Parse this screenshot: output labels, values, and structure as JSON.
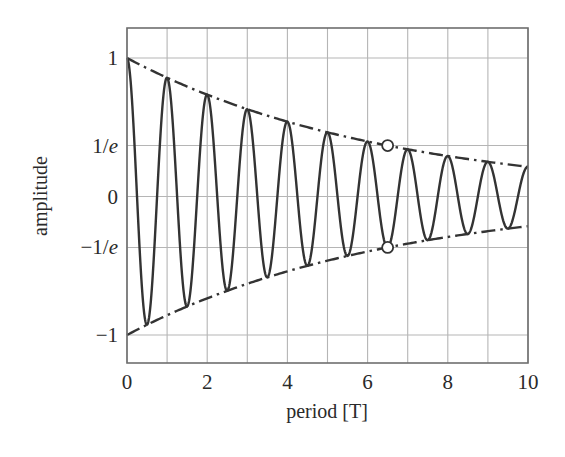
{
  "chart_data": {
    "type": "line",
    "title": "",
    "xlabel": "period [T]",
    "ylabel": "amplitude",
    "xlim": [
      0,
      10
    ],
    "ylim": [
      -1.1,
      1.1
    ],
    "grid": true,
    "legend": null,
    "x_ticks": [
      {
        "value": 0,
        "label": "0"
      },
      {
        "value": 2,
        "label": "2"
      },
      {
        "value": 4,
        "label": "4"
      },
      {
        "value": 6,
        "label": "6"
      },
      {
        "value": 8,
        "label": "8"
      },
      {
        "value": 10,
        "label": "10"
      }
    ],
    "y_ticks": [
      {
        "value": 1,
        "label": "1"
      },
      {
        "value": 0.3679,
        "label": "1/e",
        "num": "1/",
        "var": "e"
      },
      {
        "value": 0,
        "label": "0"
      },
      {
        "value": -0.3679,
        "label": "−1/e",
        "num": "−1/",
        "var": "e"
      },
      {
        "value": -1,
        "label": "−1"
      }
    ],
    "x_grid": [
      0,
      1,
      2,
      3,
      4,
      5,
      6,
      7,
      8,
      9,
      10
    ],
    "y_grid": [
      1,
      0.3679,
      0,
      -0.3679,
      -1
    ],
    "series": [
      {
        "name": "damped oscillation",
        "style": "solid",
        "function": "exp(-t/6.5) * cos(2*pi*t)",
        "decay_time_constant": 6.5,
        "period": 1,
        "x_range": [
          0,
          10
        ],
        "peaks": [
          {
            "x": 0,
            "y": 1.0
          },
          {
            "x": 0.5,
            "y": -0.926
          },
          {
            "x": 1,
            "y": 0.857
          },
          {
            "x": 1.5,
            "y": -0.794
          },
          {
            "x": 2,
            "y": 0.735
          },
          {
            "x": 2.5,
            "y": -0.681
          },
          {
            "x": 3,
            "y": 0.63
          },
          {
            "x": 3.5,
            "y": -0.584
          },
          {
            "x": 4,
            "y": 0.54
          },
          {
            "x": 4.5,
            "y": -0.5
          },
          {
            "x": 5,
            "y": 0.463
          },
          {
            "x": 5.5,
            "y": -0.429
          },
          {
            "x": 6,
            "y": 0.397
          },
          {
            "x": 6.5,
            "y": -0.368
          },
          {
            "x": 7,
            "y": 0.341
          },
          {
            "x": 7.5,
            "y": -0.316
          },
          {
            "x": 8,
            "y": 0.292
          },
          {
            "x": 8.5,
            "y": -0.271
          },
          {
            "x": 9,
            "y": 0.25
          },
          {
            "x": 9.5,
            "y": -0.232
          },
          {
            "x": 10,
            "y": 0.215
          }
        ]
      },
      {
        "name": "upper envelope",
        "style": "dash-dot",
        "function": "exp(-t/6.5)",
        "sign": 1,
        "points": [
          {
            "x": 0,
            "y": 1.0
          },
          {
            "x": 6.5,
            "y": 0.368
          },
          {
            "x": 10,
            "y": 0.215
          }
        ]
      },
      {
        "name": "lower envelope",
        "style": "dash-dot",
        "function": "-exp(-t/6.5)",
        "sign": -1,
        "points": [
          {
            "x": 0,
            "y": -1.0
          },
          {
            "x": 6.5,
            "y": -0.368
          },
          {
            "x": 10,
            "y": -0.215
          }
        ]
      }
    ],
    "annotations": [
      {
        "type": "open-circle",
        "x": 6.5,
        "y": 0.3679,
        "note": "envelope reaches 1/e"
      },
      {
        "type": "open-circle",
        "x": 6.5,
        "y": -0.3679,
        "note": "envelope reaches -1/e"
      }
    ],
    "colors": {
      "curve": "#333333",
      "grid": "#b5b5b5",
      "frame": "#6e6e6e",
      "text": "#2a2a2a",
      "background": "#ffffff"
    }
  }
}
